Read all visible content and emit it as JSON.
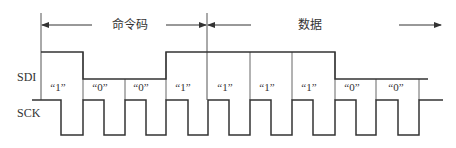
{
  "diagram": {
    "type": "timing-diagram",
    "signals": [
      {
        "name": "SDI",
        "label": "SDI"
      },
      {
        "name": "SCK",
        "label": "SCK"
      }
    ],
    "sections": [
      {
        "label": "命令码",
        "from_bit": 0,
        "to_bit": 4
      },
      {
        "label": "数据",
        "from_bit": 4,
        "to_bit": 9
      }
    ],
    "bits": [
      "“1”",
      "“0”",
      "“0”",
      "“1”",
      "“1”",
      "“1”",
      "“1”",
      "“0”",
      "“0”"
    ],
    "bit_values": [
      1,
      0,
      0,
      1,
      1,
      1,
      1,
      0,
      0
    ],
    "colors": {
      "line": "#333333",
      "divider": "#555555",
      "text": "#333333",
      "background": "#ffffff"
    }
  }
}
